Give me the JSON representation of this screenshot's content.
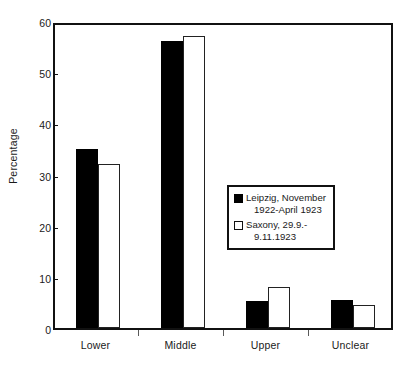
{
  "chart_data": {
    "type": "bar",
    "title": "",
    "xlabel": "",
    "ylabel": "Percentage",
    "ylim": [
      0,
      60
    ],
    "ytick_values": [
      0,
      10,
      20,
      30,
      40,
      50,
      60
    ],
    "ytick_labels": [
      "0",
      "10",
      "20",
      "30",
      "40",
      "50",
      "60"
    ],
    "grid": false,
    "legend_position": "center-right inside axes",
    "categories": [
      "Lower",
      "Middle",
      "Upper",
      "Unclear"
    ],
    "series": [
      {
        "name": "Leipzig, November 1922-April 1923",
        "color": "#000000",
        "values": [
          35,
          56,
          5.3,
          5.5
        ]
      },
      {
        "name": "Saxony, 29.9.-9.11.1923",
        "color": "#ffffff",
        "values": [
          32,
          57,
          8,
          4.5
        ]
      }
    ]
  },
  "legend": {
    "entries": [
      {
        "swatch": "filled-black-square",
        "line1": "Leipzig, November",
        "line2": "1922-April 1923"
      },
      {
        "swatch": "open-white-square",
        "line1": "Saxony, 29.9.-",
        "line2": "9.11.1923"
      }
    ]
  }
}
